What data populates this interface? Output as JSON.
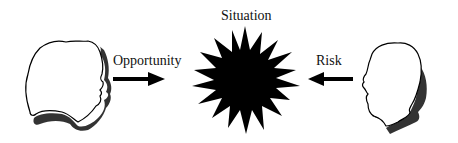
{
  "diagram": {
    "center": {
      "label": "Situation",
      "shape": "starburst",
      "color": "#000000"
    },
    "left": {
      "figure": "head-silhouette-facing-right",
      "arrow": {
        "label": "Opportunity",
        "direction": "right"
      }
    },
    "right": {
      "figure": "head-silhouette-facing-left",
      "arrow": {
        "label": "Risk",
        "direction": "left"
      }
    },
    "colors": {
      "outline": "#000000",
      "shadow": "#333333",
      "fill": "#ffffff"
    }
  }
}
